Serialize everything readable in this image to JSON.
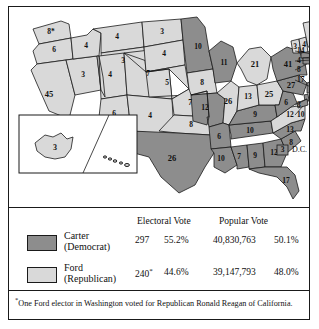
{
  "map": {
    "title": "United States presidential election map 1976",
    "colors": {
      "carter_fill": "#8d8d8d",
      "ford_fill": "#d9d9d9",
      "border": "#1a1a1a",
      "background": "#ffffff"
    },
    "states": [
      {
        "code": "WA",
        "label": "8*",
        "party": "ford"
      },
      {
        "code": "OR",
        "label": "6",
        "party": "ford"
      },
      {
        "code": "CA",
        "label": "45",
        "party": "ford"
      },
      {
        "code": "NV",
        "label": "3",
        "party": "ford"
      },
      {
        "code": "ID",
        "label": "4",
        "party": "ford"
      },
      {
        "code": "MT",
        "label": "4",
        "party": "ford"
      },
      {
        "code": "WY",
        "label": "3",
        "party": "ford"
      },
      {
        "code": "UT",
        "label": "4",
        "party": "ford"
      },
      {
        "code": "AZ",
        "label": "6",
        "party": "ford"
      },
      {
        "code": "CO",
        "label": "7",
        "party": "ford"
      },
      {
        "code": "NM",
        "label": "4",
        "party": "ford"
      },
      {
        "code": "ND",
        "label": "3",
        "party": "ford"
      },
      {
        "code": "SD",
        "label": "4",
        "party": "ford"
      },
      {
        "code": "NE",
        "label": "5",
        "party": "ford"
      },
      {
        "code": "KS",
        "label": "7",
        "party": "ford"
      },
      {
        "code": "OK",
        "label": "8",
        "party": "ford"
      },
      {
        "code": "TX",
        "label": "26",
        "party": "carter"
      },
      {
        "code": "MN",
        "label": "10",
        "party": "carter"
      },
      {
        "code": "IA",
        "label": "8",
        "party": "ford"
      },
      {
        "code": "MO",
        "label": "12",
        "party": "carter"
      },
      {
        "code": "AR",
        "label": "6",
        "party": "carter"
      },
      {
        "code": "LA",
        "label": "10",
        "party": "carter"
      },
      {
        "code": "WI",
        "label": "11",
        "party": "carter"
      },
      {
        "code": "IL",
        "label": "26",
        "party": "ford"
      },
      {
        "code": "MS",
        "label": "7",
        "party": "carter"
      },
      {
        "code": "AL",
        "label": "9",
        "party": "carter"
      },
      {
        "code": "TN",
        "label": "10",
        "party": "carter"
      },
      {
        "code": "KY",
        "label": "9",
        "party": "carter"
      },
      {
        "code": "IN",
        "label": "13",
        "party": "ford"
      },
      {
        "code": "MI",
        "label": "21",
        "party": "ford"
      },
      {
        "code": "OH",
        "label": "25",
        "party": "ford"
      },
      {
        "code": "GA",
        "label": "12",
        "party": "carter"
      },
      {
        "code": "FL",
        "label": "17",
        "party": "carter"
      },
      {
        "code": "SC",
        "label": "8",
        "party": "carter"
      },
      {
        "code": "NC",
        "label": "13",
        "party": "carter"
      },
      {
        "code": "VA",
        "label": "12",
        "party": "ford"
      },
      {
        "code": "WV",
        "label": "6",
        "party": "carter"
      },
      {
        "code": "PA",
        "label": "27",
        "party": "carter"
      },
      {
        "code": "NY",
        "label": "41",
        "party": "carter"
      },
      {
        "code": "VT",
        "label": "3",
        "party": "ford"
      },
      {
        "code": "NH",
        "label": "4",
        "party": "ford"
      },
      {
        "code": "ME",
        "label": "4",
        "party": "ford"
      },
      {
        "code": "AK",
        "label": "3",
        "party": "ford"
      },
      {
        "code": "HI",
        "label": "",
        "party": "ford"
      }
    ],
    "leader_states": [
      {
        "code": "MA",
        "label": "14",
        "party": "carter"
      },
      {
        "code": "RI",
        "label": "4",
        "party": "carter"
      },
      {
        "code": "CT",
        "label": "8",
        "party": "carter"
      },
      {
        "code": "NJ",
        "label": "17",
        "party": "carter"
      },
      {
        "code": "DE",
        "label": "3",
        "party": "carter"
      },
      {
        "code": "MD",
        "label": "10",
        "party": "carter"
      }
    ],
    "dc": {
      "label": "3",
      "name": "D.C.",
      "party": "carter"
    }
  },
  "legend": {
    "headers": {
      "electoral": "Electoral Vote",
      "popular": "Popular Vote"
    },
    "rows": [
      {
        "party_line1": "Carter",
        "party_line2": "(Democrat)",
        "electoral_votes": "297",
        "electoral_pct": "55.2%",
        "popular_votes": "40,830,763",
        "popular_pct": "50.1%",
        "swatch": "carter",
        "asterisk": false
      },
      {
        "party_line1": "Ford",
        "party_line2": "(Republican)",
        "electoral_votes": "240",
        "electoral_pct": "44.6%",
        "popular_votes": "39,147,793",
        "popular_pct": "48.0%",
        "swatch": "ford",
        "asterisk": true
      }
    ],
    "footnote": "One Ford elector in Washington voted for Republican Ronald Reagan of California."
  }
}
